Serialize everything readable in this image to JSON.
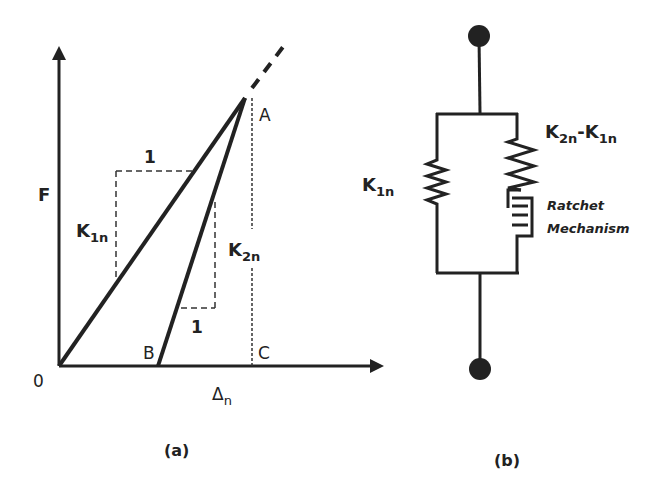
{
  "panel_a": {
    "caption": "(a)",
    "y_axis_label": "F",
    "x_axis_label": "Δ",
    "x_axis_label_sub": "n",
    "origin_label": "0",
    "point_a": "A",
    "point_b": "B",
    "point_c": "C",
    "k1_label": "K",
    "k1_sub": "1n",
    "k2_label": "K",
    "k2_sub": "2n",
    "k1_run_label": "1",
    "k2_run_label": "1"
  },
  "panel_b": {
    "caption": "(b)",
    "left_spring_label": "K",
    "left_spring_sub": "1n",
    "right_spring_label_a": "K",
    "right_spring_sub_a": "2n",
    "right_spring_dash": "-K",
    "right_spring_sub_b": "1n",
    "ratchet_line1": "Ratchet",
    "ratchet_line2": "Mechanism"
  },
  "colors": {
    "ink": "#222222",
    "background": "#ffffff"
  }
}
